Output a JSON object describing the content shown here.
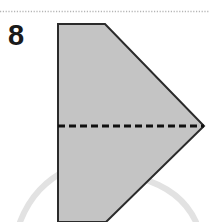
{
  "figure": {
    "type": "origami-fold-diagram",
    "step_number": "8",
    "canvas": {
      "width": 209,
      "height": 222,
      "background": "#ffffff"
    },
    "separator": {
      "name": "dotted-rule",
      "style": "dotted",
      "color": "#b4b4b4",
      "y": 11,
      "x_start": 0,
      "x_end": 209
    },
    "paper_shape": {
      "name": "folded-paper-polygon",
      "fill": "#c4c4c4",
      "stroke": "#2b2b2b",
      "stroke_width": 2,
      "points": "58,24 105,24 204,126 106,222 58,222"
    },
    "fold_line": {
      "name": "valley-fold-dashed-line",
      "color": "#111111",
      "stroke_width": 3,
      "dash": "7,4",
      "x_start": 58,
      "x_end": 204,
      "y": 126
    },
    "background_arcs": [
      {
        "name": "left-arc",
        "color": "#e2e2e2",
        "stroke_width": 6,
        "path": "M 20 222 C 30 196, 46 180, 70 168"
      },
      {
        "name": "right-arc",
        "color": "#e2e2e2",
        "stroke_width": 6,
        "path": "M 196 222 C 186 200, 168 186, 140 178"
      }
    ]
  }
}
